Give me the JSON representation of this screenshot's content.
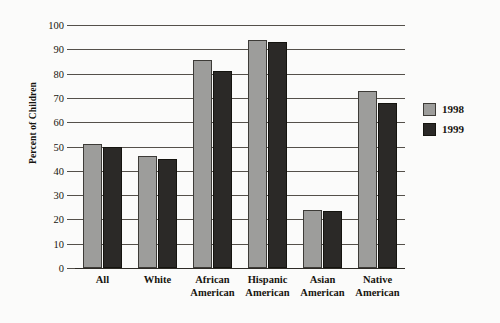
{
  "chart_data": {
    "type": "bar",
    "title": "",
    "subtitle": "",
    "xlabel": "",
    "ylabel": "Percent of Children",
    "ylim": [
      0,
      100
    ],
    "ytick_step": 10,
    "yticks": [
      0,
      10,
      20,
      30,
      40,
      50,
      60,
      70,
      80,
      90,
      100
    ],
    "ytick_labels": [
      "0",
      "10",
      "20",
      "30",
      "40",
      "50",
      "60",
      "70",
      "80",
      "90",
      "100"
    ],
    "grid": "horizontal",
    "legend_position": "right",
    "categories": [
      "All",
      "White",
      "African American",
      "Hispanic American",
      "Asian American",
      "Native American"
    ],
    "category_lines": [
      [
        "All"
      ],
      [
        "White"
      ],
      [
        "African",
        "American"
      ],
      [
        "Hispanic",
        "American"
      ],
      [
        "Asian",
        "American"
      ],
      [
        "Native",
        "American"
      ]
    ],
    "series": [
      {
        "name": "1998",
        "color": "#9d9d9b",
        "values": [
          51,
          46,
          85.5,
          94,
          24,
          73
        ]
      },
      {
        "name": "1999",
        "color": "#2b2927",
        "values": [
          50,
          45,
          81,
          93,
          23.5,
          68
        ]
      }
    ]
  },
  "legend": {
    "items": [
      {
        "label": "1998",
        "color": "#9d9d9b"
      },
      {
        "label": "1999",
        "color": "#2b2927"
      }
    ]
  },
  "axis": {
    "y_title": "Percent of Children"
  },
  "colors": {
    "series_1998": "#9d9d9b",
    "series_1999": "#2b2927",
    "axis": "#54504a",
    "text": "#17150f",
    "background": "#fbfbfa"
  }
}
